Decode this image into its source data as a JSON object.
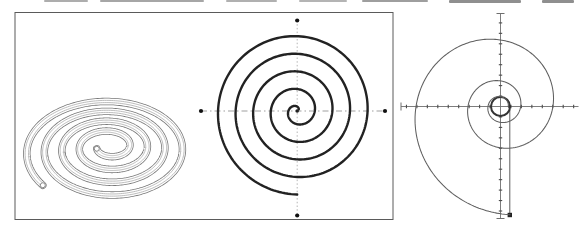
{
  "page": {
    "width": 583,
    "height": 231,
    "background": "#ffffff"
  },
  "top_crop_artifacts": {
    "comment": "gray remnants of a cut-off text line along the very top edge",
    "segments": [
      {
        "x": 44,
        "w": 44,
        "h": 2,
        "color": "#adadad"
      },
      {
        "x": 100,
        "w": 104,
        "h": 2,
        "color": "#a6a6a6"
      },
      {
        "x": 226,
        "w": 51,
        "h": 2,
        "color": "#b0b0b0"
      },
      {
        "x": 299,
        "w": 48,
        "h": 2,
        "color": "#b4b4b4"
      },
      {
        "x": 362,
        "w": 66,
        "h": 2,
        "color": "#9e9e9e"
      },
      {
        "x": 449,
        "w": 72,
        "h": 3,
        "color": "#8f8f8f"
      },
      {
        "x": 542,
        "w": 32,
        "h": 3,
        "color": "#8f8f8f"
      }
    ]
  },
  "frame": {
    "x1": 15,
    "y1": 12.5,
    "x2": 393,
    "y2": 219.5,
    "stroke": "#5a5a5a",
    "stroke_width": 1,
    "fill": "#ffffff"
  },
  "coil3d": {
    "description": "3D tube coil spiral seen in oblique view, white tube with gray outlines",
    "cx": 109,
    "cy_inner": 146,
    "cy_outer": 152,
    "rx_inner": 13,
    "rx_outer": 84,
    "ry_inner": 8,
    "ry_outer": 54,
    "theta_start_deg": 200,
    "theta_end_deg": 1658,
    "tube_outline_color": "#7a7a7a",
    "tube_outline_width": 7.4,
    "tube_fill_color": "#ffffff",
    "tube_fill_width": 5.8,
    "contour_color": "#ababab",
    "contour_width": 0.8,
    "contour_offset": 1.7,
    "endcap_radius": 2.5,
    "endcap_stroke": "#7a7a7a",
    "endcap_fill": "#ffffff"
  },
  "archimedean": {
    "description": "bold flat Archimedean spiral with dash-dot axes and end dots",
    "cx": 297.2,
    "cy": 111,
    "c_per_radian": 2.8,
    "theta_start_rad": 0.8,
    "theta_end_rad": 29.845,
    "stroke": "#222222",
    "stroke_width": 2.4,
    "center_dot_radius": 1.8,
    "axis_h": {
      "x1": 201,
      "x2": 385,
      "y": 111,
      "color": "#9a9a9a",
      "width": 0.95,
      "dash": "6 3 1.5 3"
    },
    "axis_v": {
      "x": 297.2,
      "y1": 20.5,
      "y2": 215.5,
      "color": "#aeaeae",
      "width": 0.9,
      "dash": "1.5 2.2"
    },
    "end_dots": {
      "color": "#111111",
      "radius": 2.1,
      "points": [
        {
          "x": 201,
          "y": 111
        },
        {
          "x": 385,
          "y": 111
        },
        {
          "x": 297.2,
          "y": 20.5
        },
        {
          "x": 297.2,
          "y": 215.5
        }
      ]
    }
  },
  "log_spiral": {
    "description": "thin logarithmic spiral over ticked axes, bold circle at origin, vertical chord from start to end with square end marker",
    "cx": 500.5,
    "cy": 106.5,
    "r0": 7.76,
    "k": 0.152,
    "theta_start_rad": 0,
    "theta_end_rad": 17.367,
    "stroke": "#5f5f5f",
    "stroke_width": 1.05,
    "circle": {
      "r": 9.5,
      "stroke": "#333333",
      "width": 2
    },
    "start_dot": {
      "x": 509.5,
      "y": 106.5,
      "r": 1.6,
      "color": "#333333"
    },
    "chord": {
      "x": 509.8,
      "y1": 106.5,
      "y2": 215,
      "color": "#5f5f5f",
      "width": 1
    },
    "end_square": {
      "x": 509.8,
      "y": 215,
      "size": 4.4,
      "color": "#222222"
    },
    "axis_h": {
      "x1": 401,
      "x2": 578.5,
      "y": 106.5,
      "color": "#6e6e6e",
      "width": 0.9,
      "end_cross_len": 8
    },
    "axis_v": {
      "x": 500.5,
      "y1": 13.5,
      "y2": 218.5,
      "color": "#6e6e6e",
      "width": 0.9,
      "end_cross_len": 8
    },
    "ticks": {
      "spacing": 10.45,
      "length": 3.4,
      "width": 1.1,
      "color": "#4d4d4d"
    }
  }
}
